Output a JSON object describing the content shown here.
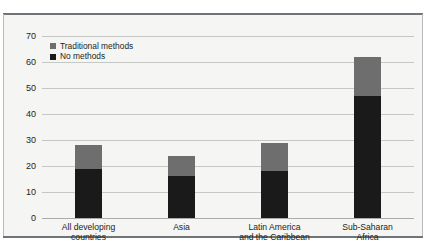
{
  "chart_data": {
    "type": "bar",
    "stacked": true,
    "title": "",
    "subtitle": "",
    "xlabel": "",
    "ylabel": "",
    "ylim": [
      0,
      70
    ],
    "ytick_step": 10,
    "yticks": [
      70,
      60,
      50,
      40,
      30,
      20,
      10,
      0
    ],
    "grid": true,
    "legend_position": "top-left",
    "categories": [
      "All developing\ncountries",
      "Asia",
      "Latin America\nand the Caribbean",
      "Sub-Saharan\nAfrica"
    ],
    "series": [
      {
        "name": "No methods",
        "color": "#1a1a1a",
        "values": [
          19,
          16,
          18,
          47
        ]
      },
      {
        "name": "Traditional methods",
        "color": "#6e6e6e",
        "values": [
          9,
          8,
          11,
          15
        ]
      }
    ],
    "totals": [
      28,
      24,
      29,
      62
    ],
    "legend": [
      {
        "label": "Traditional methods",
        "color": "#6e6e6e"
      },
      {
        "label": "No methods",
        "color": "#1a1a1a"
      }
    ]
  },
  "colors": {
    "panel_background": "#f5f5f3",
    "gridline": "#c6c8c6",
    "rule": "#6f7479",
    "side_border": "#b9bcbe",
    "text": "#231f20",
    "traditional_methods": "#6e6e6e",
    "no_methods": "#1a1a1a"
  }
}
